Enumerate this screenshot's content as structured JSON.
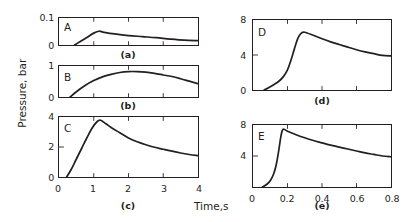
{
  "axis_labels": {
    "y": "Pressure, bar",
    "x": "Time,s"
  },
  "panels": {
    "a": {
      "caption": "(a)",
      "curve_label": "A",
      "yticks": [
        "0.1",
        "0"
      ],
      "xticks": []
    },
    "b": {
      "caption": "(b)",
      "curve_label": "B",
      "yticks": [
        "1",
        "0"
      ],
      "xticks": []
    },
    "c": {
      "caption": "(c)",
      "curve_label": "C",
      "yticks": [
        "4",
        "2",
        "0"
      ],
      "xticks": [
        "0",
        "1",
        "2",
        "3",
        "4"
      ]
    },
    "d": {
      "caption": "(d)",
      "curve_label": "D",
      "yticks": [
        "8",
        "4",
        "0"
      ],
      "xticks": []
    },
    "e": {
      "caption": "(e)",
      "curve_label": "E",
      "yticks": [
        "8",
        "4"
      ],
      "xticks": [
        "0",
        "0.2",
        "0.4",
        "0.6",
        "0.8"
      ]
    }
  },
  "chart_data": {
    "type": "line",
    "title": "",
    "xlabel": "Time,s",
    "ylabel": "Pressure, bar",
    "grid": false,
    "legend": "none",
    "colors": {
      "curve": "#231f20",
      "axis": "#231f20",
      "background": "#ffffff"
    },
    "panels": [
      {
        "id": "a",
        "caption": "(a)",
        "series_name": "A",
        "xlim": [
          0,
          4
        ],
        "ylim": [
          0,
          0.1
        ],
        "xticks": [
          0,
          1,
          2,
          3,
          4
        ],
        "xticklabels": [
          "",
          "",
          "",
          "",
          ""
        ],
        "yticks": [
          0,
          0.1
        ],
        "yticklabels": [
          "0",
          "0.1"
        ],
        "x": [
          0.45,
          0.6,
          0.8,
          1.0,
          1.15,
          1.3,
          1.6,
          2.0,
          2.4,
          2.8,
          3.2,
          3.6,
          4.0
        ],
        "y": [
          0.0,
          0.012,
          0.028,
          0.044,
          0.051,
          0.047,
          0.041,
          0.035,
          0.031,
          0.027,
          0.022,
          0.018,
          0.016
        ]
      },
      {
        "id": "b",
        "caption": "(b)",
        "series_name": "B",
        "xlim": [
          0,
          4
        ],
        "ylim": [
          0,
          1
        ],
        "xticks": [
          0,
          1,
          2,
          3,
          4
        ],
        "xticklabels": [
          "",
          "",
          "",
          "",
          ""
        ],
        "yticks": [
          0,
          1
        ],
        "yticklabels": [
          "0",
          "1"
        ],
        "x": [
          0.32,
          0.5,
          0.75,
          1.0,
          1.25,
          1.5,
          1.75,
          2.0,
          2.25,
          2.5,
          2.75,
          3.0,
          3.25,
          3.5,
          3.75,
          4.0
        ],
        "y": [
          0.0,
          0.17,
          0.37,
          0.53,
          0.65,
          0.73,
          0.79,
          0.82,
          0.82,
          0.8,
          0.76,
          0.71,
          0.66,
          0.59,
          0.51,
          0.43
        ]
      },
      {
        "id": "c",
        "caption": "(c)",
        "series_name": "C",
        "xlim": [
          0,
          4
        ],
        "ylim": [
          0,
          4
        ],
        "xticks": [
          0,
          1,
          2,
          3,
          4
        ],
        "xticklabels": [
          "0",
          "1",
          "2",
          "3",
          "4"
        ],
        "yticks": [
          0,
          2,
          4
        ],
        "yticklabels": [
          "0",
          "2",
          "4"
        ],
        "x": [
          0.22,
          0.35,
          0.5,
          0.65,
          0.8,
          0.95,
          1.1,
          1.2,
          1.35,
          1.5,
          1.75,
          2.0,
          2.25,
          2.5,
          2.75,
          3.0,
          3.25,
          3.5,
          3.75,
          4.0
        ],
        "y": [
          0.0,
          0.5,
          1.2,
          1.9,
          2.6,
          3.25,
          3.7,
          3.78,
          3.55,
          3.3,
          2.95,
          2.6,
          2.35,
          2.15,
          1.98,
          1.85,
          1.72,
          1.6,
          1.5,
          1.42
        ]
      },
      {
        "id": "d",
        "caption": "(d)",
        "series_name": "D",
        "xlim": [
          0,
          0.8
        ],
        "ylim": [
          0,
          8
        ],
        "xticks": [
          0,
          0.2,
          0.4,
          0.6,
          0.8
        ],
        "xticklabels": [
          "",
          "",
          "",
          "",
          ""
        ],
        "yticks": [
          0,
          4,
          8
        ],
        "yticklabels": [
          "0",
          "4",
          "8"
        ],
        "x": [
          0.065,
          0.09,
          0.12,
          0.15,
          0.175,
          0.2,
          0.22,
          0.24,
          0.26,
          0.28,
          0.3,
          0.35,
          0.4,
          0.45,
          0.5,
          0.55,
          0.6,
          0.65,
          0.7,
          0.75,
          0.8
        ],
        "y": [
          0.0,
          0.25,
          0.6,
          1.0,
          1.5,
          2.3,
          3.4,
          4.7,
          5.9,
          6.5,
          6.6,
          6.25,
          5.85,
          5.5,
          5.2,
          4.9,
          4.6,
          4.35,
          4.15,
          3.95,
          3.9
        ]
      },
      {
        "id": "e",
        "caption": "(e)",
        "series_name": "E",
        "xlim": [
          0,
          0.8
        ],
        "ylim": [
          0,
          8
        ],
        "xticks": [
          0,
          0.2,
          0.4,
          0.6,
          0.8
        ],
        "xticklabels": [
          "0",
          "0.2",
          "0.4",
          "0.6",
          "0.8"
        ],
        "yticks": [
          4,
          8
        ],
        "yticklabels": [
          "4",
          "8"
        ],
        "x": [
          0.055,
          0.08,
          0.1,
          0.12,
          0.135,
          0.15,
          0.16,
          0.17,
          0.18,
          0.2,
          0.25,
          0.3,
          0.35,
          0.4,
          0.45,
          0.5,
          0.55,
          0.6,
          0.65,
          0.7,
          0.75,
          0.8
        ],
        "y": [
          0.0,
          0.35,
          0.8,
          1.7,
          2.9,
          4.8,
          6.3,
          7.3,
          7.45,
          7.2,
          6.75,
          6.35,
          6.0,
          5.7,
          5.4,
          5.15,
          4.9,
          4.65,
          4.4,
          4.2,
          4.0,
          3.9
        ]
      }
    ]
  }
}
